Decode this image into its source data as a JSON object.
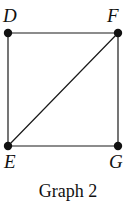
{
  "figure": {
    "caption": "Graph 2",
    "background_color": "#ffffff",
    "ink_color": "#1a1a1a",
    "label_color": "#111111"
  },
  "graph": {
    "vertices": [
      {
        "id": "D",
        "label": "D",
        "x": 8,
        "y": 33,
        "label_position": "above-left"
      },
      {
        "id": "F",
        "label": "F",
        "x": 118,
        "y": 33,
        "label_position": "above-left"
      },
      {
        "id": "E",
        "label": "E",
        "x": 8,
        "y": 146,
        "label_position": "below-left"
      },
      {
        "id": "G",
        "label": "G",
        "x": 118,
        "y": 146,
        "label_position": "below-right"
      }
    ],
    "edges": [
      {
        "from": "D",
        "to": "F",
        "kind": "top-edge"
      },
      {
        "from": "F",
        "to": "G",
        "kind": "right-edge"
      },
      {
        "from": "E",
        "to": "G",
        "kind": "bottom-edge"
      },
      {
        "from": "D",
        "to": "E",
        "kind": "left-edge"
      },
      {
        "from": "E",
        "to": "F",
        "kind": "diagonal-edge"
      }
    ],
    "vertex_radius": 4.2,
    "edge_width": 1.2
  }
}
